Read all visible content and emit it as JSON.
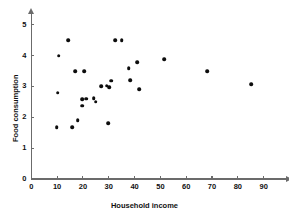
{
  "chart_data": {
    "type": "scatter",
    "title": "",
    "xlabel": "Household income",
    "ylabel": "Food consumption",
    "xlim": [
      0,
      95
    ],
    "ylim": [
      0,
      5.35
    ],
    "xticks": [
      0,
      10,
      20,
      30,
      40,
      50,
      60,
      70,
      80,
      90
    ],
    "xticklabels": [
      "0",
      "10",
      "20",
      "30",
      "40",
      "50",
      "60",
      "70",
      "80",
      "90"
    ],
    "yticks": [
      0,
      1,
      2,
      3,
      4,
      5
    ],
    "yticklabels": [
      "0",
      "1",
      "2",
      "3",
      "4",
      "5"
    ],
    "grid": false,
    "legend": null,
    "marker": "filled-circle",
    "marker_color": "#0d0d0d",
    "axis_color": "#6b6b6b",
    "x": [
      9.9,
      10.3,
      10.6,
      14.2,
      15.8,
      17.0,
      18.0,
      19.6,
      19.8,
      20.6,
      21.2,
      24.2,
      25.0,
      27.0,
      29.2,
      29.8,
      30.2,
      31.0,
      32.6,
      35.0,
      37.8,
      38.2,
      41.0,
      41.8,
      51.5,
      68.2,
      85.2
    ],
    "y": [
      1.68,
      2.8,
      4.0,
      4.5,
      1.68,
      3.5,
      1.9,
      2.38,
      2.58,
      3.5,
      2.6,
      2.62,
      2.5,
      3.0,
      3.02,
      1.8,
      2.98,
      3.18,
      4.5,
      4.5,
      3.6,
      3.2,
      3.78,
      2.92,
      3.88,
      3.5,
      3.08
    ]
  }
}
